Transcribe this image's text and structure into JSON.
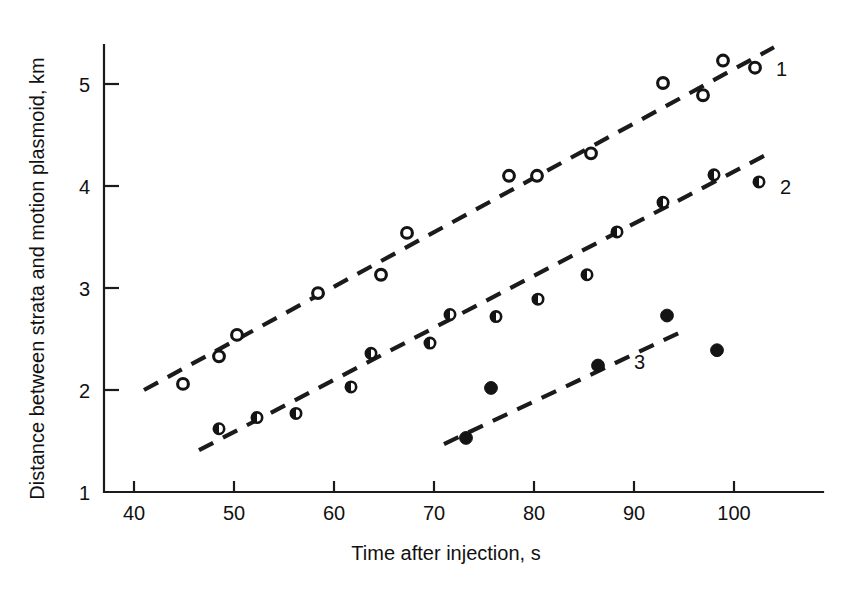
{
  "chart_data": {
    "type": "scatter",
    "title": "",
    "xlabel": "Time after injection, s",
    "ylabel": "Distance between strata and motion plasmoid, km",
    "xlim": [
      38,
      107
    ],
    "ylim": [
      1,
      5.45
    ],
    "xticks": [
      40,
      50,
      60,
      70,
      80,
      90,
      100
    ],
    "yticks": [
      1,
      2,
      3,
      4,
      5
    ],
    "xtick_labels": [
      "40",
      "50",
      "60",
      "70",
      "80",
      "90",
      "100"
    ],
    "ytick_labels": [
      "1",
      "2",
      "3",
      "4",
      "5"
    ],
    "grid": false,
    "legend_position": "inline-right-of-series",
    "series": [
      {
        "name": "1",
        "label": "1",
        "marker": "open-circle",
        "label_x": 104.2,
        "label_y": 5.15,
        "points": [
          {
            "x": 44.9,
            "y": 2.06
          },
          {
            "x": 48.5,
            "y": 2.33
          },
          {
            "x": 50.3,
            "y": 2.54
          },
          {
            "x": 58.4,
            "y": 2.95
          },
          {
            "x": 64.7,
            "y": 3.13
          },
          {
            "x": 67.3,
            "y": 3.54
          },
          {
            "x": 77.5,
            "y": 4.1
          },
          {
            "x": 80.3,
            "y": 4.1
          },
          {
            "x": 85.7,
            "y": 4.32
          },
          {
            "x": 92.9,
            "y": 5.01
          },
          {
            "x": 96.9,
            "y": 4.89
          },
          {
            "x": 98.9,
            "y": 5.23
          },
          {
            "x": 102.1,
            "y": 5.16
          }
        ],
        "fit_line": {
          "x1": 41.0,
          "y1": 2.0,
          "x2": 104.0,
          "y2": 5.36
        }
      },
      {
        "name": "2",
        "label": "2",
        "marker": "half-filled-circle",
        "label_x": 104.6,
        "label_y": 3.99,
        "points": [
          {
            "x": 48.5,
            "y": 1.62
          },
          {
            "x": 52.3,
            "y": 1.73
          },
          {
            "x": 56.2,
            "y": 1.77
          },
          {
            "x": 61.7,
            "y": 2.03
          },
          {
            "x": 63.7,
            "y": 2.36
          },
          {
            "x": 69.6,
            "y": 2.46
          },
          {
            "x": 71.6,
            "y": 2.74
          },
          {
            "x": 76.2,
            "y": 2.72
          },
          {
            "x": 80.4,
            "y": 2.89
          },
          {
            "x": 85.3,
            "y": 3.13
          },
          {
            "x": 88.3,
            "y": 3.55
          },
          {
            "x": 92.9,
            "y": 3.84
          },
          {
            "x": 98.0,
            "y": 4.11
          },
          {
            "x": 102.5,
            "y": 4.04
          }
        ],
        "fit_line": {
          "x1": 46.5,
          "y1": 1.41,
          "x2": 103.5,
          "y2": 4.32
        }
      },
      {
        "name": "3",
        "label": "3",
        "marker": "filled-circle",
        "label_x": 90.0,
        "label_y": 2.27,
        "points": [
          {
            "x": 73.2,
            "y": 1.53
          },
          {
            "x": 75.7,
            "y": 2.02
          },
          {
            "x": 86.4,
            "y": 2.24
          },
          {
            "x": 93.3,
            "y": 2.73
          },
          {
            "x": 98.3,
            "y": 2.39
          }
        ],
        "fit_line": {
          "x1": 71.0,
          "y1": 1.47,
          "x2": 94.5,
          "y2": 2.56
        }
      }
    ]
  }
}
